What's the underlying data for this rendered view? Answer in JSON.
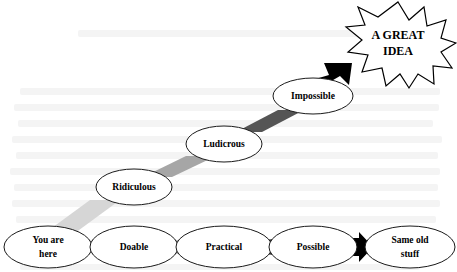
{
  "diagram": {
    "type": "flow-staircase",
    "canvas": {
      "width": 457,
      "height": 272
    },
    "bottom_row": {
      "nodes": [
        {
          "id": "you-are-here",
          "label_line1": "You are",
          "label_line2": "here",
          "cx": 48,
          "cy": 247,
          "rx": 44,
          "ry": 21,
          "font_size": 9.5
        },
        {
          "id": "doable",
          "label_line1": "Doable",
          "label_line2": "",
          "cx": 134,
          "cy": 247,
          "rx": 44,
          "ry": 21,
          "font_size": 9.5
        },
        {
          "id": "practical",
          "label_line1": "Practical",
          "label_line2": "",
          "cx": 224,
          "cy": 247,
          "rx": 48,
          "ry": 21,
          "font_size": 9.5
        },
        {
          "id": "possible",
          "label_line1": "Possible",
          "label_line2": "",
          "cx": 313,
          "cy": 247,
          "rx": 44,
          "ry": 21,
          "font_size": 9.5
        },
        {
          "id": "same-old-stuff",
          "label_line1": "Same old",
          "label_line2": "stuff",
          "cx": 410,
          "cy": 247,
          "rx": 45,
          "ry": 21,
          "font_size": 9.5
        }
      ],
      "connectors": [
        {
          "id": "conn-you-doable",
          "from": "you-are-here",
          "to": "doable",
          "x": 88,
          "y": 241,
          "w": 14,
          "h": 13,
          "color": "#e2e2e2"
        },
        {
          "id": "conn-doable-practical",
          "from": "doable",
          "to": "practical",
          "x": 172,
          "y": 241,
          "w": 14,
          "h": 13,
          "color": "#8f8f8f"
        },
        {
          "id": "conn-practical-possible",
          "from": "practical",
          "to": "possible",
          "x": 266,
          "y": 240,
          "w": 15,
          "h": 14,
          "color": "#3a3a3a"
        }
      ],
      "arrow": {
        "id": "arrow-possible-same-old",
        "from": "possible",
        "to": "same-old-stuff",
        "color": "#000000"
      }
    },
    "stair_nodes": [
      {
        "id": "ridiculous",
        "label": "Ridiculous",
        "cx": 134,
        "cy": 187,
        "rx": 38,
        "ry": 18,
        "font_size": 9.5
      },
      {
        "id": "ludicrous",
        "label": "Ludicrous",
        "cx": 224,
        "cy": 144,
        "rx": 38,
        "ry": 18,
        "font_size": 9.5
      },
      {
        "id": "impossible",
        "label": "Impossible",
        "cx": 313,
        "cy": 96,
        "rx": 40,
        "ry": 18,
        "font_size": 9.5
      }
    ],
    "stair_connectors": [
      {
        "id": "conn-you-ridiculous",
        "from": "you-are-here",
        "to": "ridiculous",
        "color": "#d6d6d6"
      },
      {
        "id": "conn-ridiculous-ludicrous",
        "from": "ridiculous",
        "to": "ludicrous",
        "color": "#a6a6a6"
      },
      {
        "id": "conn-ludicrous-impossible",
        "from": "ludicrous",
        "to": "impossible",
        "color": "#555555"
      }
    ],
    "burst": {
      "id": "a-great-idea-burst",
      "label_line1": "A GREAT",
      "label_line2": "IDEA",
      "cx": 398,
      "cy": 43,
      "rx": 56,
      "ry": 42,
      "points": 12,
      "font_size": 12,
      "fill": "#ffffff",
      "stroke": "#000000"
    },
    "final_arrow": {
      "id": "arrow-impossible-burst",
      "from": "impossible",
      "to": "a-great-idea-burst",
      "color": "#000000"
    },
    "colors": {
      "node_fill": "#ffffff",
      "node_stroke": "#1a1a1a",
      "text": "#000000",
      "arrow": "#000000",
      "background": "#ffffff"
    }
  }
}
